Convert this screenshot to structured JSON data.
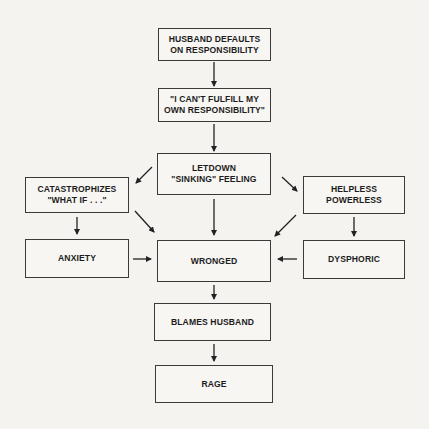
{
  "diagram": {
    "type": "flowchart",
    "nodes": [
      {
        "id": "husband_defaults",
        "label": "HUSBAND DEFAULTS\nON RESPONSIBILITY",
        "lines": [
          "HUSBAND DEFAULTS",
          "ON RESPONSIBILITY"
        ]
      },
      {
        "id": "cant_fulfill",
        "label": "\"I CAN'T FULFILL MY OWN RESPONSIBILITY\"",
        "lines": [
          "\"I CAN'T FULFILL MY",
          "OWN RESPONSIBILITY\""
        ]
      },
      {
        "id": "letdown",
        "label": "LETDOWN \"SINKING\" FEELING",
        "lines": [
          "LETDOWN",
          "\"SINKING\" FEELING"
        ]
      },
      {
        "id": "catastrophizes",
        "label": "CATASTROPHIZES \"WHAT IF . . .\"",
        "lines": [
          "CATASTROPHIZES",
          "\"WHAT IF . . .\""
        ]
      },
      {
        "id": "helpless",
        "label": "HELPLESS POWERLESS",
        "lines": [
          "HELPLESS",
          "POWERLESS"
        ]
      },
      {
        "id": "anxiety",
        "label": "ANXIETY",
        "lines": [
          "ANXIETY"
        ]
      },
      {
        "id": "wronged",
        "label": "WRONGED",
        "lines": [
          "WRONGED"
        ]
      },
      {
        "id": "dysphoric",
        "label": "DYSPHORIC",
        "lines": [
          "DYSPHORIC"
        ]
      },
      {
        "id": "blames_husband",
        "label": "BLAMES HUSBAND",
        "lines": [
          "BLAMES HUSBAND"
        ]
      },
      {
        "id": "rage",
        "label": "RAGE",
        "lines": [
          "RAGE"
        ]
      }
    ],
    "edges": [
      {
        "from": "husband_defaults",
        "to": "cant_fulfill"
      },
      {
        "from": "cant_fulfill",
        "to": "letdown"
      },
      {
        "from": "letdown",
        "to": "catastrophizes"
      },
      {
        "from": "letdown",
        "to": "helpless"
      },
      {
        "from": "letdown",
        "to": "wronged"
      },
      {
        "from": "catastrophizes",
        "to": "anxiety"
      },
      {
        "from": "catastrophizes",
        "to": "wronged"
      },
      {
        "from": "helpless",
        "to": "dysphoric"
      },
      {
        "from": "helpless",
        "to": "wronged"
      },
      {
        "from": "anxiety",
        "to": "wronged"
      },
      {
        "from": "dysphoric",
        "to": "wronged"
      },
      {
        "from": "wronged",
        "to": "blames_husband"
      },
      {
        "from": "blames_husband",
        "to": "rage"
      }
    ]
  },
  "colors": {
    "background": "#f4f3f0",
    "box_border": "#3a3a3a",
    "text": "#1c1c1c",
    "bleed_through_text": "#d8d6d2"
  }
}
